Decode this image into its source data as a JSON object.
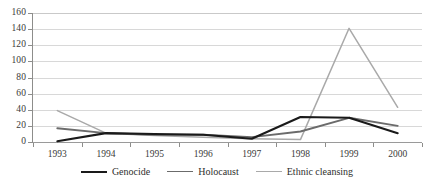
{
  "chart_data": {
    "type": "line",
    "title": "",
    "subtitle": "",
    "xlabel": "",
    "ylabel": "",
    "categories": [
      "1993",
      "1994",
      "1995",
      "1996",
      "1997",
      "1998",
      "1999",
      "2000"
    ],
    "ylim": [
      0,
      160
    ],
    "yticks": [
      0,
      20,
      40,
      60,
      80,
      100,
      120,
      140,
      160
    ],
    "ytick_labels": [
      "0",
      "20",
      "40",
      "60",
      "80",
      "100",
      "120",
      "140",
      "160"
    ],
    "grid": true,
    "grid_axis": "y",
    "legend_position": "bottom",
    "series": [
      {
        "name": "Genocide",
        "color": "#1a1a1a",
        "width": 2.1,
        "values": [
          1,
          11,
          10,
          9,
          4,
          31,
          30,
          11
        ]
      },
      {
        "name": "Holocaust",
        "color": "#6b6b6b",
        "width": 1.9,
        "values": [
          17,
          11,
          9,
          9,
          6,
          13,
          30,
          20
        ]
      },
      {
        "name": "Ethnic cleansing",
        "color": "#a9a9a9",
        "width": 1.5,
        "values": [
          39,
          11,
          8,
          6,
          4,
          3,
          141,
          43
        ]
      }
    ]
  },
  "legend": {
    "items": [
      {
        "label": "Genocide"
      },
      {
        "label": "Holocaust"
      },
      {
        "label": "Ethnic cleansing"
      }
    ]
  }
}
